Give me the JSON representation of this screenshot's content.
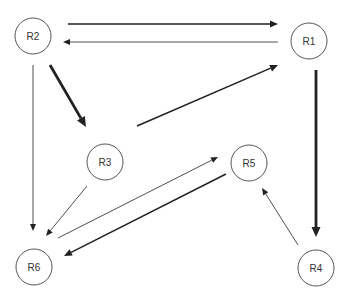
{
  "diagram": {
    "type": "directed-graph",
    "width": 352,
    "height": 299,
    "colors": {
      "edge": "#222222",
      "node_stroke": "#555555",
      "label": "#333333",
      "background": "#ffffff"
    },
    "nodes": [
      {
        "id": "R1",
        "label": "R1",
        "cx": 309,
        "cy": 41,
        "r": 18
      },
      {
        "id": "R2",
        "label": "R2",
        "cx": 33,
        "cy": 36,
        "r": 18
      },
      {
        "id": "R3",
        "label": "R3",
        "cx": 105,
        "cy": 162,
        "r": 18
      },
      {
        "id": "R4",
        "label": "R4",
        "cx": 316,
        "cy": 268,
        "r": 18
      },
      {
        "id": "R5",
        "label": "R5",
        "cx": 249,
        "cy": 163,
        "r": 18
      },
      {
        "id": "R6",
        "label": "R6",
        "cx": 34,
        "cy": 267,
        "r": 18
      }
    ],
    "edges": [
      {
        "from": "R2",
        "to": "R1",
        "weight": "medium",
        "x1": 68,
        "y1": 24,
        "x2": 278,
        "y2": 24
      },
      {
        "from": "R1",
        "to": "R2",
        "weight": "thin",
        "x1": 278,
        "y1": 42,
        "x2": 63,
        "y2": 42
      },
      {
        "from": "R2",
        "to": "R3",
        "weight": "thick",
        "x1": 50,
        "y1": 65,
        "x2": 86,
        "y2": 127
      },
      {
        "from": "R3",
        "to": "R1",
        "weight": "medium",
        "x1": 137,
        "y1": 126,
        "x2": 278,
        "y2": 65
      },
      {
        "from": "R2",
        "to": "R6",
        "weight": "thin",
        "x1": 33,
        "y1": 65,
        "x2": 33,
        "y2": 231
      },
      {
        "from": "R3",
        "to": "R6",
        "weight": "thin",
        "x1": 87,
        "y1": 186,
        "x2": 46,
        "y2": 236
      },
      {
        "from": "R6",
        "to": "R5",
        "weight": "thin",
        "x1": 58,
        "y1": 238,
        "x2": 218,
        "y2": 157
      },
      {
        "from": "R5",
        "to": "R6",
        "weight": "medium",
        "x1": 226,
        "y1": 174,
        "x2": 64,
        "y2": 256
      },
      {
        "from": "R1",
        "to": "R4",
        "weight": "thick",
        "x1": 316,
        "y1": 70,
        "x2": 316,
        "y2": 237
      },
      {
        "from": "R4",
        "to": "R5",
        "weight": "thin",
        "x1": 298,
        "y1": 245,
        "x2": 262,
        "y2": 188
      }
    ]
  }
}
